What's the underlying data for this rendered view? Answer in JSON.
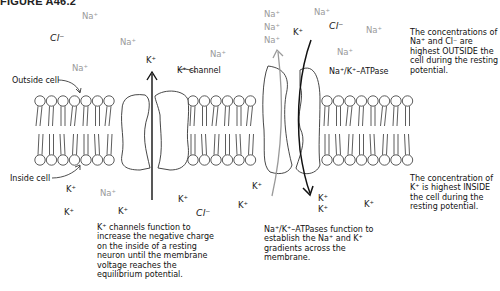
{
  "figure": {
    "title": "FIGURE A46.2"
  },
  "labels": {
    "outside_cell": "Outside cell",
    "inside_cell": "Inside cell",
    "k_channel": "K⁺ channel",
    "pump": "Na⁺/K⁺–ATPase",
    "k_flow": "K⁺"
  },
  "ions_outside": [
    {
      "type": "Na",
      "text": "Na⁺"
    },
    {
      "type": "Cl",
      "text": "Cl⁻"
    },
    {
      "type": "Na",
      "text": "Na⁺"
    },
    {
      "type": "Na",
      "text": "Na⁺"
    },
    {
      "type": "Na",
      "text": "Na⁺"
    },
    {
      "type": "Na",
      "text": "Na⁺"
    },
    {
      "type": "Na",
      "text": "Na⁺"
    },
    {
      "type": "Na",
      "text": "Na⁺"
    },
    {
      "type": "K",
      "text": "K⁺"
    },
    {
      "type": "Cl",
      "text": "Cl⁻"
    },
    {
      "type": "Na",
      "text": "Na⁺"
    },
    {
      "type": "Na",
      "text": "Na⁺"
    },
    {
      "type": "Na",
      "text": "Na⁺"
    }
  ],
  "ions_inside": [
    {
      "type": "K",
      "text": "K⁺"
    },
    {
      "type": "Na",
      "text": "Na⁺"
    },
    {
      "type": "K",
      "text": "K⁺"
    },
    {
      "type": "K",
      "text": "K⁺"
    },
    {
      "type": "K",
      "text": "K⁺"
    },
    {
      "type": "Cl",
      "text": "Cl⁻"
    },
    {
      "type": "K",
      "text": "K⁺"
    },
    {
      "type": "K",
      "text": "K⁺"
    },
    {
      "type": "K",
      "text": "K⁺"
    },
    {
      "type": "K",
      "text": "K⁺"
    },
    {
      "type": "K",
      "text": "K⁺"
    }
  ],
  "notes": {
    "outside_concentration": "The concentrations of Na⁺ and Cl⁻ are highest OUTSIDE the cell during the resting potential.",
    "inside_concentration": "The concentration of K⁺ is highest INSIDE the cell during the resting potential.",
    "k_channel_function": "K⁺ channels function to increase the negative charge on the inside of a resting neuron until the membrane voltage reaches the equilibrium potential.",
    "pump_function": "Na⁺/K⁺–ATPases function to establish the Na⁺ and K⁺ gradients across the membrane."
  },
  "colors": {
    "ink": "#222222",
    "sodium": "#9a9a9a",
    "pump_na_arrow": "#9a9a9a"
  }
}
